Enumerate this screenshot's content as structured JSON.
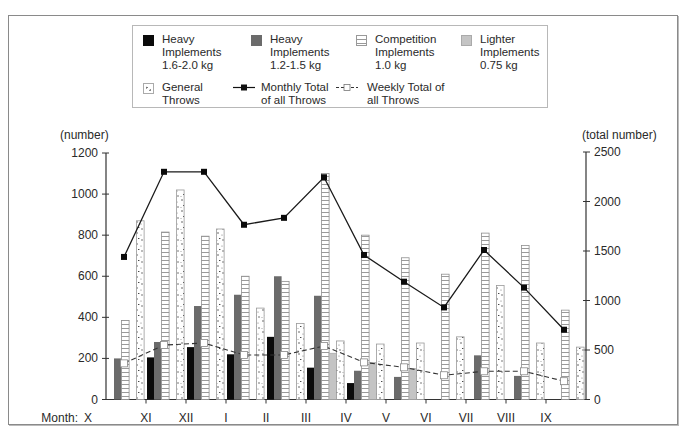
{
  "chart_data": {
    "type": "bar",
    "title": "",
    "xlabel": "Month:",
    "ylabel": "(number)",
    "y2label": "(total number)",
    "ylim": [
      0,
      1200
    ],
    "y2lim": [
      0,
      2500
    ],
    "yticks": [
      0,
      200,
      400,
      600,
      800,
      1000,
      1200
    ],
    "y2ticks": [
      0,
      500,
      1000,
      1500,
      2000,
      2500
    ],
    "grid": false,
    "legend_position": "top",
    "categories": [
      "X",
      "XI",
      "XII",
      "I",
      "II",
      "III",
      "IV",
      "V",
      "VI",
      "VII",
      "VIII",
      "IX"
    ],
    "series": [
      {
        "name": "Heavy Implements 1.6-2.0 kg",
        "type": "bar",
        "axis": "left",
        "color": "#0a0a0a",
        "values": [
          0,
          205,
          255,
          220,
          305,
          155,
          80,
          0,
          0,
          0,
          0,
          0
        ]
      },
      {
        "name": "Heavy Implements 1.2-1.5 kg",
        "type": "bar",
        "axis": "left",
        "color": "#6b6b6b",
        "values": [
          200,
          280,
          455,
          510,
          600,
          505,
          140,
          110,
          0,
          215,
          115,
          0
        ]
      },
      {
        "name": "Competition Implements 1.0 kg",
        "type": "bar",
        "axis": "left",
        "color": "#ffffff",
        "pattern": "horizontal-lines",
        "values": [
          385,
          815,
          795,
          600,
          575,
          1100,
          800,
          690,
          610,
          810,
          750,
          435
        ]
      },
      {
        "name": "Lighter Implements 0.75 kg",
        "type": "bar",
        "axis": "left",
        "color": "#c4c4c4",
        "values": [
          0,
          0,
          0,
          0,
          0,
          225,
          180,
          150,
          0,
          0,
          0,
          0
        ]
      },
      {
        "name": "General Throws",
        "type": "bar",
        "axis": "left",
        "color": "#ffffff",
        "pattern": "speckle",
        "values": [
          870,
          1020,
          830,
          445,
          370,
          285,
          270,
          275,
          305,
          555,
          275,
          255
        ]
      },
      {
        "name": "Monthly Total of all Throws",
        "type": "line",
        "axis": "right",
        "style": "solid",
        "marker": "filled-square",
        "values": [
          1440,
          2300,
          2300,
          1765,
          1835,
          2245,
          1460,
          1190,
          930,
          1510,
          1130,
          705
        ]
      },
      {
        "name": "Weekly Total of all Throws",
        "type": "line",
        "axis": "right",
        "style": "dashed",
        "marker": "open-square",
        "values": [
          365,
          550,
          570,
          450,
          450,
          540,
          375,
          325,
          245,
          285,
          285,
          185
        ]
      }
    ]
  },
  "legend": {
    "items": [
      {
        "label_lines": [
          "Heavy",
          "Implements",
          "1.6-2.0 kg"
        ]
      },
      {
        "label_lines": [
          "Heavy",
          "Implements",
          "1.2-1.5 kg"
        ]
      },
      {
        "label_lines": [
          "Competition",
          "Implements",
          "1.0 kg"
        ]
      },
      {
        "label_lines": [
          "Lighter",
          "Implements",
          "0.75 kg"
        ]
      },
      {
        "label_lines": [
          "General",
          "Throws"
        ]
      },
      {
        "label_lines": [
          "Monthly Total",
          "of all Throws"
        ]
      },
      {
        "label_lines": [
          "Weekly Total of",
          "all Throws"
        ]
      }
    ]
  },
  "axes": {
    "left_title": "(number)",
    "right_title": "(total number)",
    "x_title": "Month:"
  }
}
